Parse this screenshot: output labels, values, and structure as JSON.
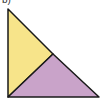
{
  "label": "b)",
  "colors": {
    "yellow_region": "#f7e48a",
    "purple_region": "#c9a3c9",
    "outline": "#1a1a1a"
  },
  "shapes": [
    {
      "name": "yellow-triangle",
      "points": "8,9 8,97 53,54"
    },
    {
      "name": "purple-triangle",
      "points": "8,97 99,97 53,54"
    }
  ]
}
